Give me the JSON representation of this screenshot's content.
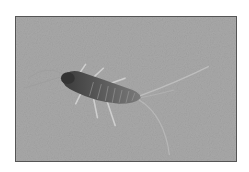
{
  "image": {
    "subject": "silverfish insect",
    "description": "Grayscale photograph of a silverfish on a textured gray surface, with long antennae and three tail filaments",
    "colors": {
      "background": "#a9a9a9",
      "body_dark": "#3d3d3d",
      "body_mid": "#6b6b6b",
      "segments": "#8a8a8a",
      "legs": "#c8c8c8",
      "frame_border": "#555555"
    }
  },
  "caption": ""
}
